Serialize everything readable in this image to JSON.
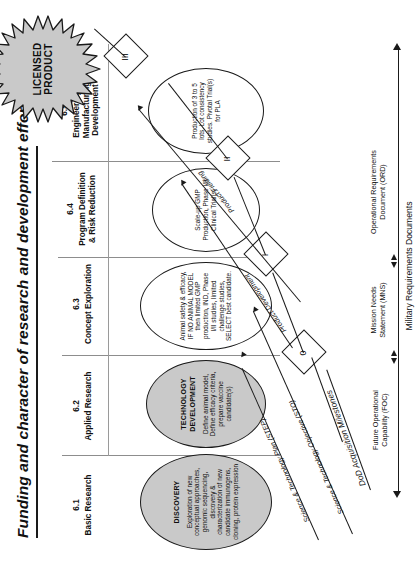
{
  "title": "Funding and character of research and development effort",
  "phases": [
    {
      "num": "6.1",
      "name": "Basic Research"
    },
    {
      "num": "6.2",
      "name": "Applied Research"
    },
    {
      "num": "6.3",
      "name": "Concept Exploration"
    },
    {
      "num": "6.4",
      "name": "Program Definition\n& Risk Reduction"
    },
    {
      "num": "6.5",
      "name": "Engineering &\nManufacturing\nDevelopment"
    }
  ],
  "phase_labels": {
    "p1_num": "6.1",
    "p1_name": "Basic Research",
    "p2_num": "6.2",
    "p2_name": "Applied Research",
    "p3_num": "6.3",
    "p3_name": "Concept Exploration",
    "p4_num": "6.4",
    "p4_name_l1": "Program Definition",
    "p4_name_l2": "& Risk Reduction",
    "p5_num": "6.5",
    "p5_name_l1": "Engineering &",
    "p5_name_l2": "Manufacturing",
    "p5_name_l3": "Development"
  },
  "stages": [
    {
      "id": "discovery",
      "title": "DISCOVERY",
      "body": "Exploration of new conceptual approaches, genomic sequencing, discovery & characterization of new candidate immunogens, cloning, protein expression",
      "fill": "#c9c9c9"
    },
    {
      "id": "technology-development",
      "title_l1": "TECHNOLOGY",
      "title_l2": "DEVELOPMENT",
      "body": "Define animal model, Define efficacy criteria, prepare vaccine candidate(s)",
      "fill": "#c9c9c9"
    },
    {
      "id": "animal-safety",
      "title": "",
      "body": "Animal safety & efficacy, IF NO ANIMAL MODEL then limited GMP production, IND, Phase I/II studies, limited challenge studies, SELECT best candidate.",
      "fill": "#ffffff"
    },
    {
      "id": "scale-up",
      "title": "",
      "body": "Scale-up GMP Production, Phase I/II Clinical Trial(s)",
      "fill": "#ffffff"
    },
    {
      "id": "production-lots",
      "title": "",
      "body": "Production of 3 to 5 lots. Lot consistency studies. Pivotal Trial(s) for PLA",
      "fill": "#ffffff"
    }
  ],
  "product": {
    "label_l1": "LICENSED",
    "label_l2": "PRODUCT",
    "shape": "starburst",
    "fill": "#c9c9c9"
  },
  "milestones": [
    {
      "id": "ms-0",
      "label": "0"
    },
    {
      "id": "ms-1",
      "label": "I"
    },
    {
      "id": "ms-2",
      "label": "II"
    },
    {
      "id": "ms-3",
      "label": "III"
    }
  ],
  "flows": [
    {
      "id": "step",
      "label": "Science & Technology Plan (STEP)"
    },
    {
      "id": "sto",
      "label": "Science & Technology Objective (STO)"
    },
    {
      "id": "product-development",
      "label": "Product Development"
    },
    {
      "id": "product-fielding",
      "label": "Product Fielding"
    }
  ],
  "acquisition": {
    "milestones_axis": "DoD Acquisition Milestones",
    "documents_axis": "Military Requirements Documents",
    "foc_l1": "Future Operational",
    "foc_l2": "Capability (FOC)",
    "mns_l1": "Mission Needs",
    "mns_l2": "Statement (MNS)",
    "ord_l1": "Operational Requirements",
    "ord_l2": "Document (ORD)"
  },
  "colors": {
    "ink": "#111111",
    "rule": "#9a9a9a",
    "fill_gray": "#c9c9c9",
    "page": "#ffffff"
  }
}
